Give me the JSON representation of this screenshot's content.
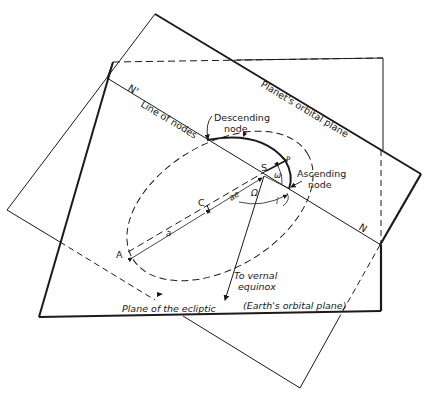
{
  "diagram": {
    "planes": {
      "orbital_plane_label": "Planet's orbital plane",
      "ecliptic_label": "Plane of the ecliptic",
      "ecliptic_sublabel": "(Earth's orbital plane)"
    },
    "line_of_nodes": {
      "label": "Line of nodes",
      "node_start": "N'",
      "node_end": "N"
    },
    "nodes": {
      "descending_line1": "Descending",
      "descending_line2": "node",
      "ascending_line1": "Ascending",
      "ascending_line2": "node"
    },
    "points": {
      "sun": "S",
      "perihelion": "P",
      "aphelion": "A",
      "center": "C"
    },
    "distances": {
      "semi_major_axis": "a",
      "focal_offset": "ae"
    },
    "angles": {
      "argument_of_perihelion": "ω",
      "longitude_of_ascending_node": "Ω",
      "inclination": "i"
    },
    "vernal_equinox": {
      "line1": "To vernal",
      "line2": "equinox"
    },
    "colors": {
      "ink": "#1a1a1a",
      "background": "#ffffff"
    }
  }
}
